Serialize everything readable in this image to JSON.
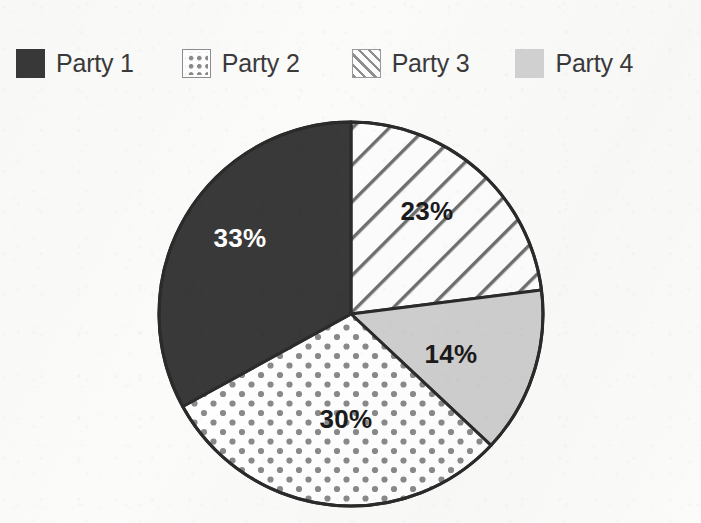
{
  "chart_data": {
    "type": "pie",
    "title": "",
    "categories": [
      "Party 1",
      "Party 2",
      "Party 3",
      "Party 4"
    ],
    "values": [
      33,
      30,
      23,
      14
    ],
    "value_labels": [
      "33%",
      "30%",
      "23%",
      "14%"
    ],
    "units": "percent",
    "legend_position": "top",
    "grid": false,
    "slice_order_clockwise_from_12oclock": [
      "Party 3",
      "Party 4",
      "Party 2",
      "Party 1"
    ],
    "slices": [
      {
        "name": "Party 1",
        "value": 33,
        "label": "33%",
        "fill_style": "solid-dark",
        "fill_color": "#393939",
        "label_color": "#ffffff",
        "label_x": 240,
        "label_y": 240
      },
      {
        "name": "Party 2",
        "value": 30,
        "label": "30%",
        "fill_style": "dotted",
        "fill_color": "#ffffff",
        "pattern_color": "#8a8a8a",
        "label_color": "#1b1b1b",
        "label_x": 346,
        "label_y": 421
      },
      {
        "name": "Party 3",
        "value": 23,
        "label": "23%",
        "fill_style": "diagonal-hatch",
        "fill_color": "#fdfdfd",
        "pattern_color": "#6f6f6f",
        "label_color": "#1b1b1b",
        "label_x": 427,
        "label_y": 213
      },
      {
        "name": "Party 4",
        "value": 14,
        "label": "14%",
        "fill_style": "solid-light",
        "fill_color": "#cfcfcf",
        "label_color": "#1b1b1b",
        "label_x": 451,
        "label_y": 356
      }
    ],
    "geometry": {
      "center_x": 351,
      "center_y": 314,
      "radius": 192,
      "outline_color": "#2b2b2b",
      "outline_width": 3
    }
  },
  "legend": {
    "items": [
      {
        "label": "Party 1",
        "swatch": "solid-dark-swatch",
        "color": "#393939"
      },
      {
        "label": "Party 2",
        "swatch": "dotted-swatch",
        "color": "#8a8a8a"
      },
      {
        "label": "Party 3",
        "swatch": "hatched-swatch",
        "color": "#8e8e8e"
      },
      {
        "label": "Party 4",
        "swatch": "solid-light-swatch",
        "color": "#d2d2d2"
      }
    ]
  },
  "page": {
    "background_color": "#fbfbfa"
  }
}
